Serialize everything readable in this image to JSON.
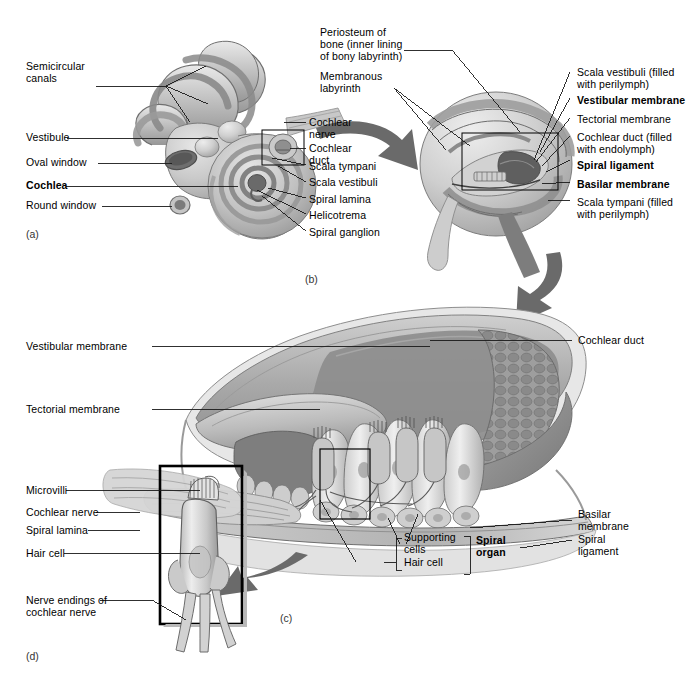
{
  "figure": {
    "panels": [
      {
        "id": "a",
        "label": "(a)",
        "caption": "Bony labyrinth of the inner ear"
      },
      {
        "id": "b",
        "label": "(b)",
        "caption": "Cross section through one turn of the cochlea"
      },
      {
        "id": "c",
        "label": "(c)",
        "caption": "Spiral organ detail"
      },
      {
        "id": "d",
        "label": "(d)",
        "caption": "Single hair cell detail"
      }
    ]
  },
  "panel_a": {
    "label": "(a)",
    "labels_left": [
      {
        "name": "semicircular-canals",
        "text": "Semicircular\ncanals",
        "bold": false
      },
      {
        "name": "vestibule",
        "text": "Vestibule",
        "bold": false
      },
      {
        "name": "oval-window",
        "text": "Oval window",
        "bold": false
      },
      {
        "name": "cochlea",
        "text": "Cochlea",
        "bold": true
      },
      {
        "name": "round-window",
        "text": "Round window",
        "bold": false
      }
    ],
    "labels_right": [
      {
        "name": "cochlear-nerve",
        "text": "Cochlear\nnerve",
        "bold": false
      },
      {
        "name": "cochlear-duct",
        "text": "Cochlear\nduct",
        "bold": false
      },
      {
        "name": "scala-tympani",
        "text": "Scala tympani",
        "bold": false
      },
      {
        "name": "scala-vestibuli",
        "text": "Scala vestibuli",
        "bold": false
      },
      {
        "name": "spiral-lamina",
        "text": "Spiral lamina",
        "bold": false
      },
      {
        "name": "helicotrema",
        "text": "Helicotrema",
        "bold": false
      },
      {
        "name": "spiral-ganglion",
        "text": "Spiral ganglion",
        "bold": false
      }
    ]
  },
  "panel_b": {
    "label": "(b)",
    "labels_left": [
      {
        "name": "periosteum-of-bone",
        "text": "Periosteum of\nbone (inner lining\nof bony labyrinth)",
        "bold": false
      },
      {
        "name": "membranous-labyrinth",
        "text": "Membranous\nlabyrinth",
        "bold": false
      }
    ],
    "labels_right": [
      {
        "name": "scala-vestibuli-perilymph",
        "text": "Scala vestibuli (filled\nwith perilymph)",
        "bold": false
      },
      {
        "name": "vestibular-membrane",
        "text": "Vestibular membrane",
        "bold": true
      },
      {
        "name": "tectorial-membrane",
        "text": "Tectorial membrane",
        "bold": false
      },
      {
        "name": "cochlear-duct-endolymph",
        "text": "Cochlear duct (filled\nwith endolymph)",
        "bold": false
      },
      {
        "name": "spiral-ligament",
        "text": "Spiral ligament",
        "bold": true
      },
      {
        "name": "basilar-membrane",
        "text": "Basilar membrane",
        "bold": true
      },
      {
        "name": "scala-tympani-perilymph",
        "text": "Scala tympani (filled\nwith perilymph)",
        "bold": false
      }
    ]
  },
  "panel_c": {
    "label": "(c)",
    "labels_left": [
      {
        "name": "vestibular-membrane",
        "text": "Vestibular membrane",
        "bold": false
      },
      {
        "name": "tectorial-membrane",
        "text": "Tectorial membrane",
        "bold": false
      },
      {
        "name": "microvilli",
        "text": "Microvilli",
        "bold": false
      },
      {
        "name": "cochlear-nerve",
        "text": "Cochlear nerve",
        "bold": false
      },
      {
        "name": "spiral-lamina",
        "text": "Spiral lamina",
        "bold": false
      },
      {
        "name": "hair-cell",
        "text": "Hair cell",
        "bold": false
      },
      {
        "name": "nerve-endings-of-cochlear-nerve",
        "text": "Nerve endings of\ncochlear nerve",
        "bold": false
      }
    ],
    "labels_right": [
      {
        "name": "cochlear-duct",
        "text": "Cochlear duct",
        "bold": false
      },
      {
        "name": "basilar-membrane",
        "text": "Basilar\nmembrane",
        "bold": false
      },
      {
        "name": "spiral-ligament",
        "text": "Spiral\nligament",
        "bold": false
      }
    ],
    "labels_center": [
      {
        "name": "supporting-cells",
        "text": "Supporting\ncells",
        "bold": false
      },
      {
        "name": "hair-cell",
        "text": "Hair cell",
        "bold": false
      },
      {
        "name": "spiral-organ",
        "text": "Spiral\norgan",
        "bold": true
      }
    ]
  },
  "panel_d": {
    "label": "(d)"
  },
  "colors": {
    "background": "#ffffff",
    "text": "#000000",
    "leader_line": "#1a1a1a",
    "arrow": "#595959",
    "tissue_light": "#d8d8d8",
    "tissue_mid": "#b4b4b4",
    "tissue_dark": "#8a8a8a",
    "tissue_darkest": "#5e5e5e",
    "outline": "#4a4a4a",
    "box_stroke": "#000000"
  }
}
